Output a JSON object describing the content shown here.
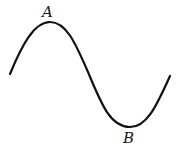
{
  "diagram": {
    "type": "sine-wave",
    "stroke_color": "#111111",
    "background": "#ffffff",
    "points": [
      {
        "id": "A",
        "label": "A",
        "role": "crest",
        "x": 50,
        "y": 22
      },
      {
        "id": "B",
        "label": "B",
        "role": "trough",
        "x": 130,
        "y": 127
      }
    ],
    "curve": {
      "start": [
        10,
        74
      ],
      "crest": [
        50,
        22
      ],
      "midline_cross": [
        88,
        72
      ],
      "trough": [
        130,
        127
      ],
      "end": [
        170,
        76
      ]
    }
  }
}
